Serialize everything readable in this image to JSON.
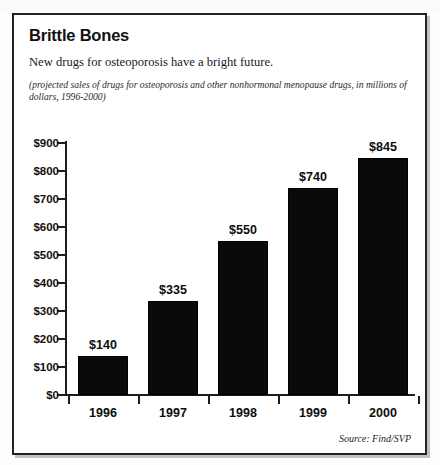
{
  "figure": {
    "title": "Brittle Bones",
    "subtitle": "New drugs for osteoporosis have a bright future.",
    "note": "(projected sales of drugs for osteoporosis and other nonhormonal menopause drugs, in millions of dollars, 1996-2000)",
    "source": "Source: Find/SVP"
  },
  "chart_data": {
    "type": "bar",
    "title": "Brittle Bones",
    "subtitle": "New drugs for osteoporosis have a bright future.",
    "annotation": "(projected sales of drugs for osteoporosis and other nonhormonal menopause drugs, in millions of dollars, 1996-2000)",
    "source": "Source: Find/SVP",
    "categories": [
      "1996",
      "1997",
      "1998",
      "1999",
      "2000"
    ],
    "values": [
      140,
      335,
      550,
      740,
      845
    ],
    "data_labels": [
      "$140",
      "$335",
      "$550",
      "$740",
      "$845"
    ],
    "xlabel": "",
    "ylabel": "",
    "ylim": [
      0,
      900
    ],
    "ytick_values": [
      0,
      100,
      200,
      300,
      400,
      500,
      600,
      700,
      800,
      900
    ],
    "ytick_labels": [
      "$0",
      "$100",
      "$200",
      "$300",
      "$400",
      "$500",
      "$600",
      "$700",
      "$800",
      "$900"
    ],
    "grid": false,
    "legend": "none",
    "bar_color": "#0a0a0a",
    "units": "millions of dollars"
  }
}
